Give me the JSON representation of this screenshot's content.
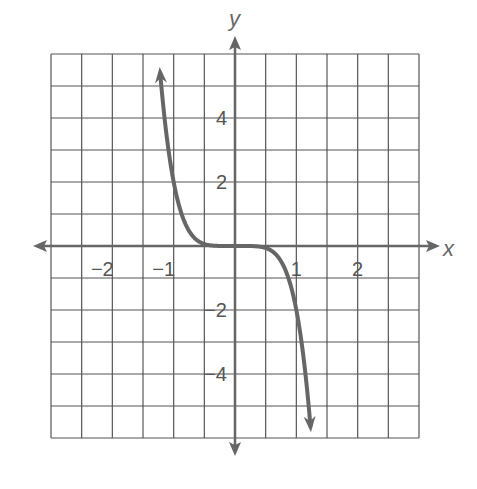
{
  "chart_data": {
    "type": "line",
    "title": "",
    "xlabel": "x",
    "ylabel": "y",
    "xlim": [
      -3,
      3
    ],
    "ylim": [
      -6,
      6
    ],
    "grid": true,
    "grid_step": {
      "x": 0.5,
      "y": 1
    },
    "x_ticks": [
      {
        "value": -2,
        "label": "−2"
      },
      {
        "value": -1,
        "label": "−1"
      },
      {
        "value": 1,
        "label": "1"
      },
      {
        "value": 2,
        "label": "2"
      }
    ],
    "y_ticks": [
      {
        "value": 4,
        "label": "4"
      },
      {
        "value": 2,
        "label": "2"
      },
      {
        "value": -2,
        "label": "−2"
      },
      {
        "value": -4,
        "label": "−4"
      }
    ],
    "series": [
      {
        "name": "y = -2x^5",
        "x": [
          -1.22,
          -1.1,
          -1.0,
          -0.9,
          -0.8,
          -0.6,
          -0.4,
          -0.2,
          0,
          0.2,
          0.4,
          0.6,
          0.8,
          0.9,
          1.0,
          1.1,
          1.23
        ],
        "values": [
          5.4,
          3.2,
          2.0,
          1.18,
          0.66,
          0.16,
          0.02,
          0.0,
          0,
          0.0,
          -0.02,
          -0.16,
          -0.66,
          -1.18,
          -2.0,
          -3.2,
          -5.6
        ],
        "arrows": "both"
      }
    ],
    "colors": {
      "grid": "#555555",
      "axis": "#666666",
      "curve": "#666666",
      "text": "#555555"
    }
  }
}
